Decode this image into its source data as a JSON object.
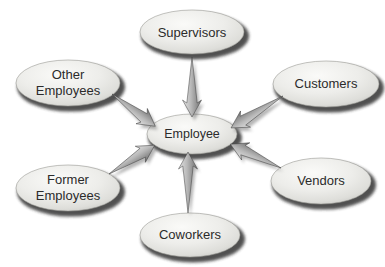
{
  "diagram": {
    "type": "radial-relationship",
    "center_node": {
      "id": "employee",
      "label": "Employee"
    },
    "nodes": [
      {
        "id": "supervisors",
        "lines": [
          "Supervisors"
        ],
        "position": "top"
      },
      {
        "id": "other-employees",
        "lines": [
          "Other",
          "Employees"
        ],
        "position": "upper-left"
      },
      {
        "id": "customers",
        "lines": [
          "Customers"
        ],
        "position": "upper-right"
      },
      {
        "id": "former-employees",
        "lines": [
          "Former",
          "Employees"
        ],
        "position": "lower-left"
      },
      {
        "id": "vendors",
        "lines": [
          "Vendors"
        ],
        "position": "lower-right"
      },
      {
        "id": "coworkers",
        "lines": [
          "Coworkers"
        ],
        "position": "bottom"
      }
    ],
    "edges": [
      {
        "from": "supervisors",
        "to": "employee"
      },
      {
        "from": "other-employees",
        "to": "employee"
      },
      {
        "from": "customers",
        "to": "employee"
      },
      {
        "from": "former-employees",
        "to": "employee"
      },
      {
        "from": "vendors",
        "to": "employee"
      },
      {
        "from": "coworkers",
        "to": "employee"
      }
    ],
    "colors": {
      "background": "#ffffff",
      "node_fill_highlight": "#fafaf8",
      "node_fill_edge": "#c6c6c2",
      "node_shadow": "#2a2a2a",
      "arrow_light": "#e6e6e6",
      "arrow_dark": "#6a6a6a",
      "text": "#2b2b2b"
    }
  }
}
